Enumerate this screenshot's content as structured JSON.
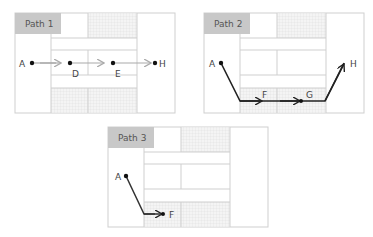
{
  "panels": [
    {
      "title": "Path 1",
      "nodes": [
        {
          "label": "A",
          "x": 32,
          "y": 63
        },
        {
          "label": "D",
          "x": 70,
          "y": 63
        },
        {
          "label": "E",
          "x": 113,
          "y": 63
        },
        {
          "label": "H",
          "x": 155,
          "y": 63
        }
      ],
      "path_style": "light-gray"
    },
    {
      "title": "Path 2",
      "nodes": [
        {
          "label": "A",
          "x": 221,
          "y": 63
        },
        {
          "label": "F",
          "x": 263,
          "y": 101
        },
        {
          "label": "G",
          "x": 301,
          "y": 101
        },
        {
          "label": "H",
          "x": 344,
          "y": 63
        }
      ],
      "path_style": "dark"
    },
    {
      "title": "Path 3",
      "nodes": [
        {
          "label": "A",
          "x": 126,
          "y": 176
        },
        {
          "label": "F",
          "x": 163,
          "y": 214
        }
      ],
      "path_style": "dark"
    }
  ],
  "colors": {
    "border": "#cfcfcf",
    "title_bg": "#c8c8c8",
    "hatch": "#e4e4e4",
    "path_light": "#aaaaaa",
    "path_dark": "#222222"
  }
}
